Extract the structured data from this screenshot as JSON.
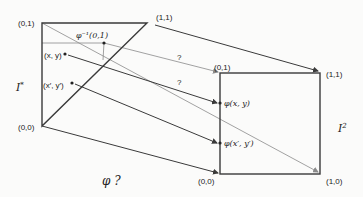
{
  "diagram": {
    "title_label": "φ ?",
    "colors": {
      "dark_stroke": "#3a3a3a",
      "gray_stroke": "#8a8a8a",
      "text": "#222222",
      "background": "#fbfbfa"
    },
    "left_shape": {
      "name": "I*",
      "label_base": "I",
      "label_sup": "*",
      "corners": {
        "top_left": {
          "label": "(0,1)",
          "x": 42,
          "y": 23
        },
        "top_right": {
          "label": "(1,1)",
          "x": 147,
          "y": 23
        },
        "bottom_left": {
          "label": "(0,0)",
          "x": 42,
          "y": 126
        }
      },
      "points": [
        {
          "id": "xy",
          "label": "(x, y)",
          "x": 65,
          "y": 54
        },
        {
          "id": "xpyp",
          "label": "(x′, y′)",
          "x": 72,
          "y": 83
        },
        {
          "id": "phi_inv",
          "label": "φ⁻¹(0,1)",
          "x": 104,
          "y": 43
        }
      ]
    },
    "right_shape": {
      "name": "I2",
      "label_base": "I",
      "label_sup": "2",
      "corners": {
        "top_left": {
          "label": "(0,1)",
          "x": 220,
          "y": 73
        },
        "top_right": {
          "label": "(1,1)",
          "x": 320,
          "y": 73
        },
        "bottom_left": {
          "label": "(0,0)",
          "x": 220,
          "y": 174
        },
        "bottom_right": {
          "label": "(1,0)",
          "x": 320,
          "y": 174
        }
      },
      "points": [
        {
          "id": "phi_xy",
          "label": "φ(x, y)",
          "x": 220,
          "y": 103
        },
        {
          "id": "phi_xpyp",
          "label": "φ(x′, y′)",
          "x": 220,
          "y": 143
        }
      ]
    },
    "question_marks": [
      {
        "label": "?",
        "x": 179,
        "y": 58
      },
      {
        "label": "?",
        "x": 179,
        "y": 83
      }
    ],
    "mappings": [
      {
        "from": "(1,1)",
        "to": "(1,1)",
        "style": "dark"
      },
      {
        "from": "(0,0)",
        "to": "(0,0)",
        "style": "dark"
      },
      {
        "from": "(x, y)",
        "to": "φ(x, y)",
        "style": "dark"
      },
      {
        "from": "(x′, y′)",
        "to": "φ(x′, y′)",
        "style": "dark"
      },
      {
        "from": "(0,1)",
        "to": "(1,0)",
        "style": "gray"
      },
      {
        "from": "φ⁻¹(0,1)",
        "to": "(0,1)",
        "style": "gray"
      }
    ]
  }
}
